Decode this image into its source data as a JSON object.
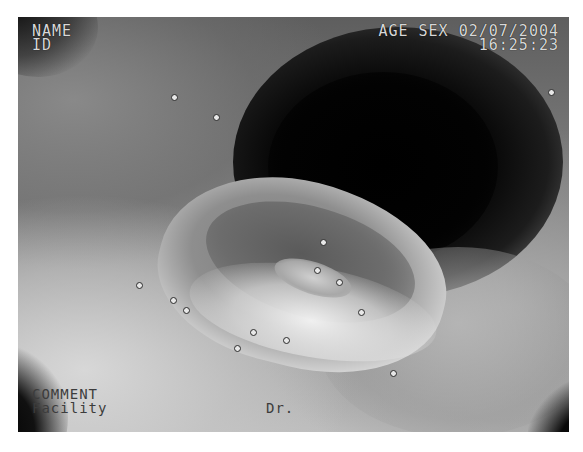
{
  "image": {
    "description": "Grayscale endoscopic image showing an oval ulcer with a raised whitish rim and darker fibrinous base on the mucosal wall, dark lumen in the upper-right",
    "colors": {
      "background": "#ffffff",
      "lumen": "#000000",
      "osd_text_top": "#d8d8d8",
      "osd_text_bottom": "#3c3c3c"
    }
  },
  "overlay": {
    "top_left": {
      "name_label": "NAME",
      "id_label": "ID"
    },
    "top_right": {
      "line1": "AGE SEX 02/07/2004",
      "time": "16:25:23"
    },
    "bottom_left": {
      "comment_label": "COMMENT",
      "facility_label": "Facility"
    },
    "bottom_center": {
      "doctor_label": "Dr."
    }
  }
}
